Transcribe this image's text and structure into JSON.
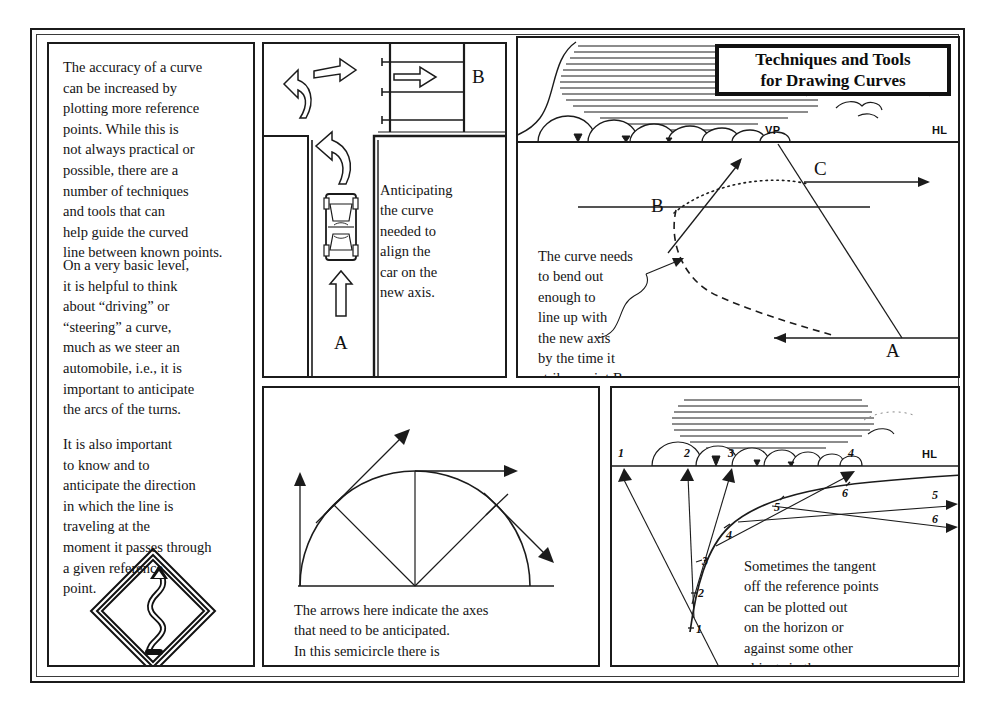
{
  "title_plate": {
    "text": "Techniques and Tools\nfor Drawing Curves"
  },
  "text_panel": {
    "paragraphs": [
      "The accuracy of a curve\ncan be increased by\nplotting more reference\npoints. While this is\nnot always practical or\npossible, there are a\nnumber of techniques\nand tools that can\nhelp guide the curved\nline between known points.",
      "On a very basic level,\nit is helpful to think\nabout “driving” or\n“steering” a curve,\nmuch as we steer an\nautomobile, i.e., it is\nimportant to anticipate\nthe arcs of the turns.",
      "It is also important\nto know and to\nanticipate the direction\nin which the line is\ntraveling at the\nmoment it passes through\na given reference\npoint."
    ],
    "sign": {
      "name": "winding-road-sign",
      "shape": "diamond",
      "symbol": "S-curve arrow"
    }
  },
  "car_panel": {
    "caption": "Anticipating\nthe curve\nneeded to\nalign the\ncar on the\nnew axis.",
    "labels": {
      "start": "A",
      "end": "B"
    },
    "parking_stalls": 3
  },
  "perspective_panel": {
    "caption": "The curve needs\nto bend out\nenough to\nline up with\nthe new axis\nby the time it\nstrikes point B.",
    "labels": {
      "vanishing_point": "VP",
      "horizon_line": "HL",
      "point_a": "A",
      "point_b": "B",
      "point_c": "C"
    }
  },
  "semicircle_panel": {
    "caption": "The arrows here indicate the axes\nthat need to be anticipated.\nIn this semicircle there is\na series of 45° turns.",
    "turn_angle": "45°",
    "arrow_count": 4
  },
  "tangent_panel": {
    "caption": "Sometimes the tangent\noff the reference points\ncan be plotted out\non the horizon or\nagainst some other\nobjects in the scene.",
    "horizon_label": "HL",
    "horizon_marks": [
      "1",
      "2",
      "3",
      "4"
    ],
    "right_marks": [
      "5",
      "6"
    ],
    "curve_points": [
      "1",
      "2",
      "3",
      "4",
      "5",
      "6"
    ]
  },
  "colors": {
    "ink": "#111111",
    "paper": "#ffffff",
    "rule": "#3a3a3a"
  }
}
